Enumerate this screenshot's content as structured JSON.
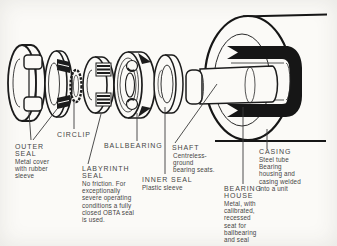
{
  "figure": {
    "background": "#fbfaf7",
    "ink": "#1c1c1c",
    "text_color": "#454545"
  },
  "labels": {
    "outer_seal": {
      "title": "OUTER\nSEAL",
      "desc": "Metal cover\nwith rubber\nsleeve"
    },
    "circlip": {
      "title": "CIRCLIP"
    },
    "labyrinth": {
      "title": "LABYRINTH\nSEAL",
      "desc": "No friction. For\nexceptionally\nsevere operating\nconditions a fully\nclosed OBTA seal\nis used."
    },
    "ballbearing": {
      "title": "BALLBEARING"
    },
    "shaft": {
      "title": "SHAFT",
      "desc": "Centreless-\nground\nbearing seats."
    },
    "inner_seal": {
      "title": "INNER SEAL",
      "desc": "Plastic sleeve"
    },
    "bearing_house": {
      "title": "BEARING\nHOUSE",
      "desc": "Metal, with\ncalibrated,\nrecessed\nseat for\nballbearing\nand seal"
    },
    "casing": {
      "title": "CASING",
      "desc": "Steel tube\nBearing\nhousing and\ncasing welded\ninto a unit"
    }
  }
}
